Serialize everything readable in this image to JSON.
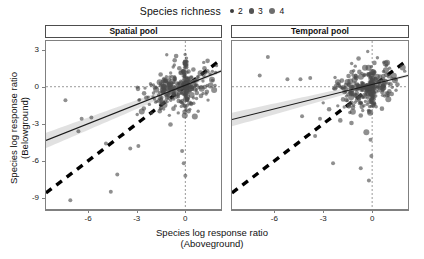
{
  "legend": {
    "title": "Species richness",
    "keys": [
      {
        "label": "2",
        "size": 4.2,
        "color": "#3d3d3d"
      },
      {
        "label": "3",
        "size": 5.4,
        "color": "#545454"
      },
      {
        "label": "4",
        "size": 6.6,
        "color": "#6e6e6e"
      }
    ]
  },
  "panels": [
    {
      "label": "Spatial pool"
    },
    {
      "label": "Temporal pool"
    }
  ],
  "axes": {
    "x_title_line1": "Species log response ratio",
    "x_title_line2": "(Aboveground)",
    "y_title_line1": "Species log response ratio",
    "y_title_line2": "(Belowground)",
    "x_ticks": [
      "-6",
      "-3",
      "0"
    ],
    "x_tick_values": [
      -6,
      -3,
      0
    ],
    "y_ticks": [
      "3",
      "0",
      "-3",
      "-6",
      "-9"
    ],
    "y_tick_values": [
      3,
      0,
      -3,
      -6,
      -9
    ],
    "xlim": [
      -8.6,
      2.2
    ],
    "ylim": [
      -9.9,
      3.7
    ]
  },
  "style": {
    "point_color": "#4a4a4a",
    "point_opacity": 0.62,
    "fit_line_color": "#1a1a1a",
    "ribbon_color": "#c9c9c9",
    "ribbon_opacity": 0.55,
    "identity_line_color": "#000000",
    "reference_line_color": "#808080",
    "panel_border_color": "#808080",
    "strip_border_color": "#4d4d4d"
  },
  "chart_data": {
    "type": "scatter",
    "title": "",
    "xlabel": "Species log response ratio (Aboveground)",
    "ylabel": "Species log response ratio (Belowground)",
    "xlim": [
      -8.6,
      2.2
    ],
    "ylim": [
      -9.9,
      3.7
    ],
    "grid": false,
    "legend_position": "top",
    "legend_title": "Species richness",
    "legend_entries": [
      "2",
      "3",
      "4"
    ],
    "facets": [
      "Spatial pool",
      "Temporal pool"
    ],
    "annotations": [
      {
        "type": "reference-line",
        "orientation": "vertical",
        "value": 0,
        "style": "dotted"
      },
      {
        "type": "reference-line",
        "orientation": "horizontal",
        "value": 0,
        "style": "dotted"
      },
      {
        "type": "identity-line",
        "slope": 1,
        "intercept": 0,
        "style": "thick-dashed"
      }
    ],
    "series": [
      {
        "name": "Spatial pool",
        "fit": {
          "slope": 0.52,
          "intercept": 0.12,
          "ci_half_width_at_xmin": 0.62,
          "ci_half_width_at_xmax": 0.12
        },
        "n_points": 300,
        "cluster": {
          "x_mean": -0.55,
          "x_sd": 1.05,
          "y_mean": -0.18,
          "y_sd": 0.95,
          "zero_inflation_x": 0.22
        },
        "outliers": [
          {
            "x": -7.1,
            "y": -9.2,
            "r": 2
          },
          {
            "x": -4.6,
            "y": -8.5,
            "r": 2
          },
          {
            "x": -7.4,
            "y": -1.1,
            "r": 2
          },
          {
            "x": -6.4,
            "y": -2.6,
            "r": 2
          },
          {
            "x": -5.8,
            "y": -2.5,
            "r": 2
          },
          {
            "x": -6.6,
            "y": -3.6,
            "r": 2
          },
          {
            "x": -4.9,
            "y": -4.6,
            "r": 2
          },
          {
            "x": -3.4,
            "y": -5.0,
            "r": 2
          },
          {
            "x": -4.2,
            "y": -7.1,
            "r": 2
          },
          {
            "x": -0.2,
            "y": -5.2,
            "r": 2
          },
          {
            "x": -0.1,
            "y": -6.2,
            "r": 2
          },
          {
            "x": 0.0,
            "y": -7.2,
            "r": 2
          },
          {
            "x": -2.9,
            "y": -4.8,
            "r": 2
          }
        ]
      },
      {
        "name": "Temporal pool",
        "fit": {
          "slope": 0.33,
          "intercept": 0.18,
          "ci_half_width_at_xmin": 0.55,
          "ci_half_width_at_xmax": 0.1
        },
        "n_points": 300,
        "cluster": {
          "x_mean": -0.45,
          "x_sd": 0.95,
          "y_mean": -0.12,
          "y_sd": 0.92,
          "zero_inflation_x": 0.26
        },
        "outliers": [
          {
            "x": -6.4,
            "y": 2.4,
            "r": 2
          },
          {
            "x": -6.9,
            "y": 0.9,
            "r": 2
          },
          {
            "x": -5.2,
            "y": 0.6,
            "r": 2
          },
          {
            "x": -4.4,
            "y": 0.6,
            "r": 2
          },
          {
            "x": -3.8,
            "y": 0.7,
            "r": 2
          },
          {
            "x": -4.3,
            "y": -2.4,
            "r": 2
          },
          {
            "x": -3.2,
            "y": -2.6,
            "r": 2
          },
          {
            "x": -3.5,
            "y": -4.0,
            "r": 2
          },
          {
            "x": -2.4,
            "y": -6.2,
            "r": 2
          },
          {
            "x": -0.7,
            "y": -6.6,
            "r": 2
          },
          {
            "x": -0.1,
            "y": -4.3,
            "r": 2
          },
          {
            "x": -0.2,
            "y": -7.6,
            "r": 2
          },
          {
            "x": -0.05,
            "y": -5.6,
            "r": 2
          }
        ]
      }
    ]
  }
}
